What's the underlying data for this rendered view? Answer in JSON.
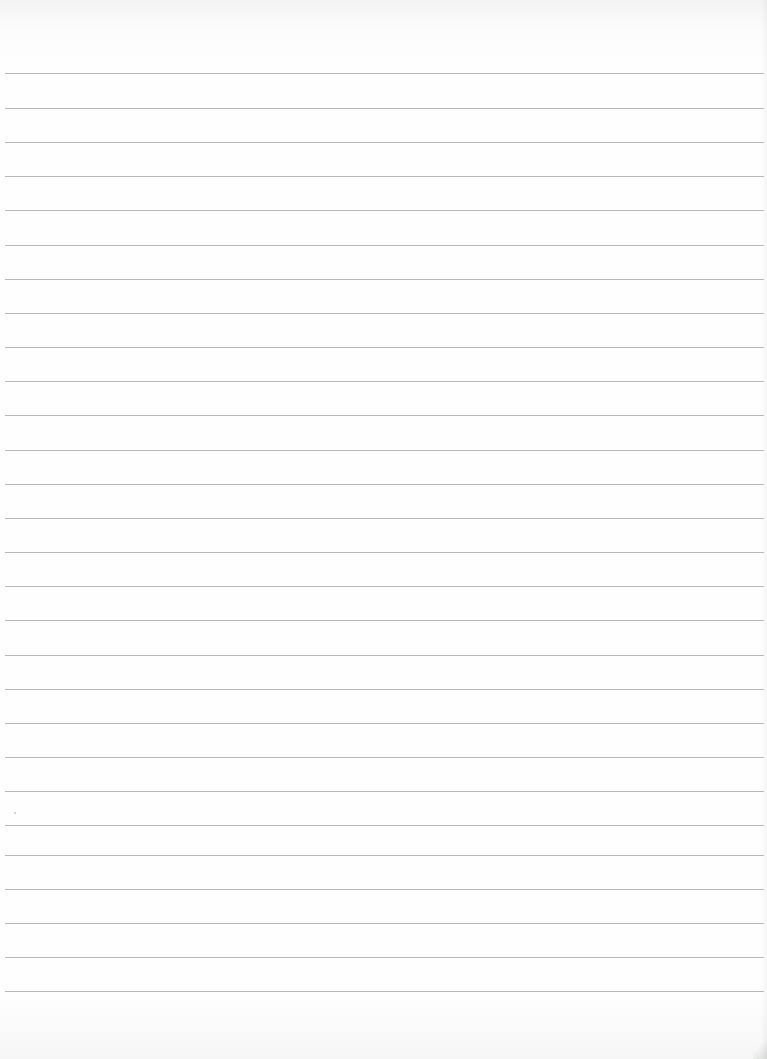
{
  "document": {
    "type": "ruled-notebook-page",
    "content_text": "",
    "paper_color": "#fdfdfd",
    "rule_color": "#b9b9b9",
    "rule_count": 28,
    "rule_spacing_px": 34,
    "rule_positions_y": [
      73,
      108,
      142,
      176,
      210,
      245,
      279,
      313,
      347,
      381,
      415,
      450,
      484,
      518,
      552,
      586,
      620,
      655,
      689,
      723,
      757,
      791,
      825,
      855,
      889,
      923,
      957,
      991
    ]
  }
}
